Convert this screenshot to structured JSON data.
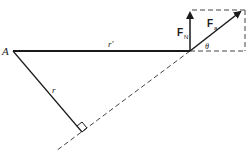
{
  "diagram": {
    "type": "torque-lever-arm",
    "labels": {
      "point": "A",
      "r_prime": "r′",
      "r": "r",
      "normal_force": "F",
      "normal_force_sub": "N",
      "applied_force": "F",
      "applied_force_sub": "a",
      "angle": "θ"
    },
    "colors": {
      "line": "#1a1a1a",
      "dashed": "#444444",
      "background": "#ffffff"
    }
  }
}
